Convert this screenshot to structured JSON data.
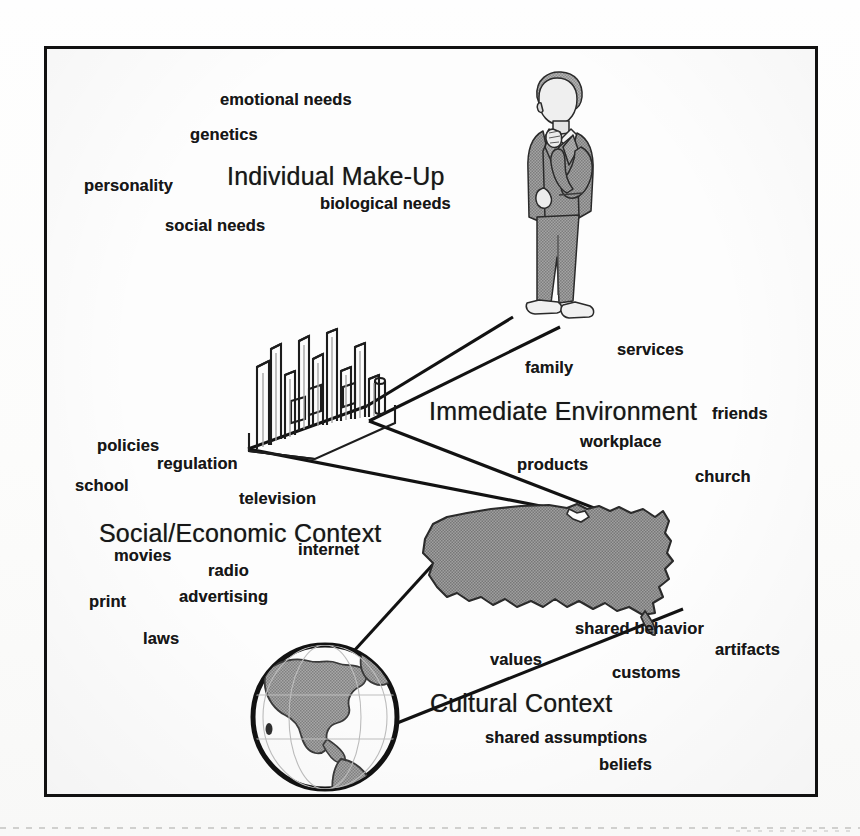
{
  "diagram": {
    "frame": {
      "border_color": "#111111",
      "background": "#fdfdfd"
    },
    "palette": {
      "ink": "#171717",
      "line": "#121212",
      "clipart_gray": "#9a9a9a",
      "clipart_gray_dark": "#8b8b8b",
      "paper": "#fdfdfd"
    },
    "levels": [
      {
        "id": "individual",
        "heading": "Individual Make-Up",
        "heading_pos": {
          "x": 180,
          "y": 113
        },
        "graphic": "businessman-figure",
        "keywords": [
          {
            "label": "emotional needs",
            "x": 173,
            "y": 41
          },
          {
            "label": "genetics",
            "x": 143,
            "y": 76
          },
          {
            "label": "personality",
            "x": 37,
            "y": 127
          },
          {
            "label": "biological needs",
            "x": 273,
            "y": 145
          },
          {
            "label": "social needs",
            "x": 118,
            "y": 167
          }
        ]
      },
      {
        "id": "immediate",
        "heading": "Immediate Environment",
        "heading_pos": {
          "x": 382,
          "y": 348
        },
        "graphic": "city-skyline",
        "keywords": [
          {
            "label": "services",
            "x": 570,
            "y": 291
          },
          {
            "label": "family",
            "x": 478,
            "y": 309
          },
          {
            "label": "friends",
            "x": 665,
            "y": 355
          },
          {
            "label": "workplace",
            "x": 533,
            "y": 383
          },
          {
            "label": "products",
            "x": 470,
            "y": 406
          },
          {
            "label": "church",
            "x": 648,
            "y": 418
          }
        ]
      },
      {
        "id": "social",
        "heading": "Social/Economic Context",
        "heading_pos": {
          "x": 52,
          "y": 470
        },
        "graphic": "usa-map",
        "keywords": [
          {
            "label": "policies",
            "x": 50,
            "y": 387
          },
          {
            "label": "regulation",
            "x": 110,
            "y": 405
          },
          {
            "label": "school",
            "x": 28,
            "y": 427
          },
          {
            "label": "television",
            "x": 192,
            "y": 440
          },
          {
            "label": "internet",
            "x": 251,
            "y": 491
          },
          {
            "label": "movies",
            "x": 67,
            "y": 497
          },
          {
            "label": "radio",
            "x": 161,
            "y": 512
          },
          {
            "label": "print",
            "x": 42,
            "y": 543
          },
          {
            "label": "advertising",
            "x": 132,
            "y": 538
          },
          {
            "label": "laws",
            "x": 96,
            "y": 580
          }
        ]
      },
      {
        "id": "cultural",
        "heading": "Cultural Context",
        "heading_pos": {
          "x": 383,
          "y": 640
        },
        "graphic": "globe",
        "keywords": [
          {
            "label": "shared behavior",
            "x": 528,
            "y": 570
          },
          {
            "label": "artifacts",
            "x": 668,
            "y": 591
          },
          {
            "label": "values",
            "x": 443,
            "y": 601
          },
          {
            "label": "customs",
            "x": 565,
            "y": 614
          },
          {
            "label": "shared assumptions",
            "x": 438,
            "y": 679
          },
          {
            "label": "beliefs",
            "x": 552,
            "y": 706
          }
        ]
      }
    ],
    "graphics": [
      {
        "id": "businessman-figure",
        "name": "businessman-clipart",
        "x": 450,
        "y": 18,
        "w": 120,
        "h": 265
      },
      {
        "id": "city-skyline",
        "name": "city-skyline-clipart",
        "x": 196,
        "y": 278,
        "w": 158,
        "h": 130
      },
      {
        "id": "usa-map",
        "name": "usa-map-silhouette",
        "x": 370,
        "y": 446,
        "w": 268,
        "h": 140
      },
      {
        "id": "globe",
        "name": "globe-clipart",
        "x": 196,
        "y": 586,
        "w": 162,
        "h": 162
      }
    ],
    "connectors": [
      {
        "from": "businessman-figure",
        "to": "city-skyline",
        "name": "connector-individual-to-environment"
      },
      {
        "from": "city-skyline",
        "to": "usa-map",
        "name": "connector-environment-to-social"
      },
      {
        "from": "usa-map",
        "to": "globe",
        "name": "connector-social-to-cultural"
      }
    ]
  }
}
